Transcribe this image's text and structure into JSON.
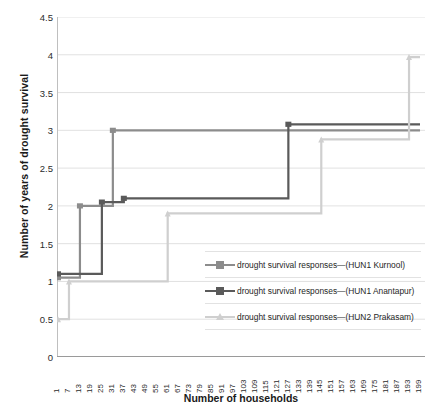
{
  "chart_data": {
    "type": "line",
    "subtype": "step",
    "title": "",
    "xlabel": "Number of households",
    "ylabel": "Number of years of drought survival",
    "ylim": [
      0,
      4.5
    ],
    "ytick_step": 0.5,
    "yticks": [
      "0",
      "0.5",
      "1",
      "1.5",
      "2",
      "2.5",
      "3",
      "3.5",
      "4",
      "4.5"
    ],
    "xlim": [
      1,
      199
    ],
    "xtick_labels": [
      "1",
      "7",
      "13",
      "19",
      "25",
      "31",
      "37",
      "43",
      "49",
      "55",
      "61",
      "67",
      "73",
      "79",
      "85",
      "91",
      "97",
      "103",
      "109",
      "115",
      "121",
      "127",
      "133",
      "139",
      "145",
      "151",
      "157",
      "163",
      "169",
      "175",
      "181",
      "187",
      "193",
      "199"
    ],
    "xtick_step": 6,
    "grid": "horizontal",
    "legend_position": "inside-right",
    "series": [
      {
        "name": "drought survival responses—(HUN1 Kurnool)",
        "color": "#8c8c8c",
        "marker": "square",
        "steps": [
          {
            "x": 1,
            "y": 1.05
          },
          {
            "x": 13,
            "y": 2.0
          },
          {
            "x": 31,
            "y": 3.0
          },
          {
            "x": 199,
            "y": 3.0
          }
        ]
      },
      {
        "name": "drought survival responses—(HUN1 Anantapur)",
        "color": "#5a5a5a",
        "marker": "square",
        "steps": [
          {
            "x": 1,
            "y": 1.1
          },
          {
            "x": 25,
            "y": 2.05
          },
          {
            "x": 37,
            "y": 2.1
          },
          {
            "x": 127,
            "y": 3.08
          },
          {
            "x": 199,
            "y": 3.08
          }
        ]
      },
      {
        "name": "drought survival responses—(HUN2 Prakasam)",
        "color": "#cfcfcf",
        "marker": "triangle",
        "steps": [
          {
            "x": 1,
            "y": 0.5
          },
          {
            "x": 7,
            "y": 1.0
          },
          {
            "x": 61,
            "y": 1.9
          },
          {
            "x": 145,
            "y": 2.88
          },
          {
            "x": 193,
            "y": 3.97
          },
          {
            "x": 199,
            "y": 3.97
          }
        ]
      }
    ]
  },
  "legend": {
    "items": [
      {
        "label": "drought survival responses—(HUN1 Kurnool)",
        "color": "#8c8c8c",
        "marker": "square"
      },
      {
        "label": "drought survival responses—(HUN1 Anantapur)",
        "color": "#5a5a5a",
        "marker": "square"
      },
      {
        "label": "drought survival responses—(HUN2 Prakasam)",
        "color": "#cfcfcf",
        "marker": "triangle"
      }
    ]
  }
}
